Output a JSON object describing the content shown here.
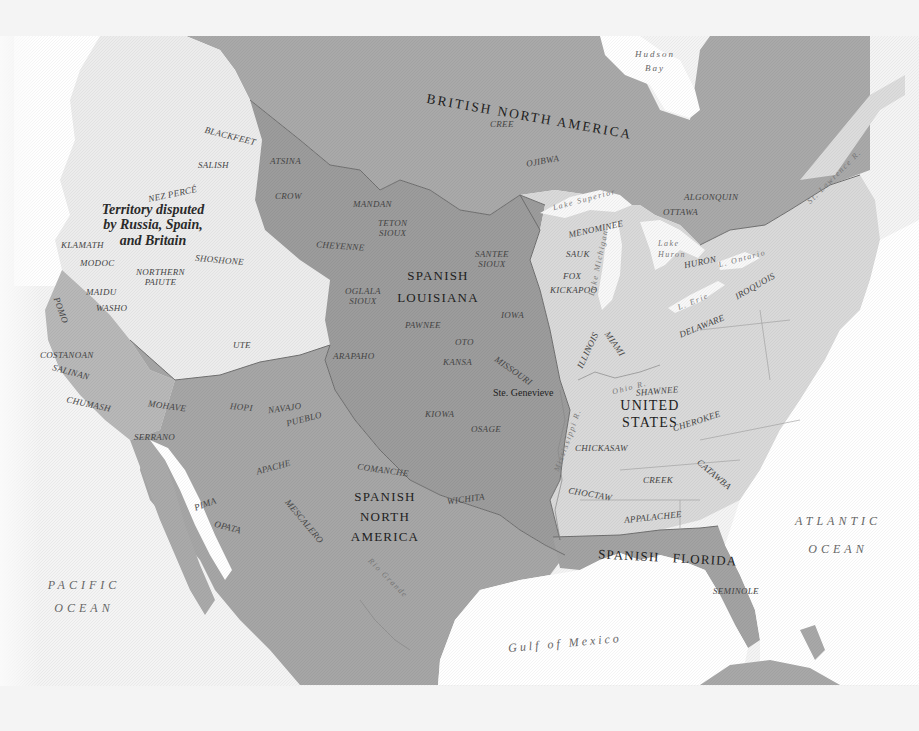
{
  "map": {
    "colors": {
      "background": "#f4f4f4",
      "water": "#ffffff",
      "british_north_america": "#a9a9a9",
      "spanish_louisiana": "#9c9c9c",
      "spanish_north_america": "#a6a6a6",
      "spanish_florida": "#a3a3a3",
      "united_states": "#d9d9d9",
      "disputed_territory": "#ececec",
      "border": "#6e6e6e"
    },
    "regions": {
      "british_north_america": "BRITISH NORTH AMERICA",
      "spanish_louisiana_1": "SPANISH",
      "spanish_louisiana_2": "LOUISIANA",
      "spanish_north_america_1": "SPANISH",
      "spanish_north_america_2": "NORTH",
      "spanish_north_america_3": "AMERICA",
      "united_states_1": "UNITED",
      "united_states_2": "STATES",
      "spanish_florida": "SPANISH   FLORIDA",
      "disputed_1": "Territory disputed",
      "disputed_2": "by Russia, Spain,",
      "disputed_3": "and Britain"
    },
    "water_bodies": {
      "hudson_bay_1": "Hudson",
      "hudson_bay_2": "Bay",
      "pacific_1": "PACIFIC",
      "pacific_2": "OCEAN",
      "atlantic_1": "ATLANTIC",
      "atlantic_2": "OCEAN",
      "gulf": "Gulf of Mexico",
      "lake_superior": "Lake Superior",
      "lake_michigan": "Lake Michigan",
      "lake_huron_1": "Lake",
      "lake_huron_2": "Huron",
      "lake_erie": "L. Erie",
      "lake_ontario": "L. Ontario",
      "st_lawrence": "St. Lawrence R.",
      "ohio_river": "Ohio R.",
      "mississippi_river": "Mississippi R.",
      "rio_grande": "Rio Grande"
    },
    "cities": {
      "ste_genevieve": "Ste. Genevieve"
    },
    "tribes": {
      "blackfeet": "BLACKFEET",
      "salish": "SALISH",
      "nez_perce": "NEZ PERCÉ",
      "atsina": "ATSINA",
      "crow": "CROW",
      "mandan": "MANDAN",
      "teton_sioux_1": "TETON",
      "teton_sioux_2": "SIOUX",
      "cheyenne": "CHEYENNE",
      "klamath": "KLAMATH",
      "modoc": "MODOC",
      "shoshone": "SHOSHONE",
      "northern_paiute_1": "NORTHERN",
      "northern_paiute_2": "PAIUTE",
      "maidu": "MAIDU",
      "washo": "WASHO",
      "pomo": "POMO",
      "costanoan": "COSTANOAN",
      "salinan": "SALINAN",
      "chumash": "CHUMASH",
      "ute": "UTE",
      "oglala_sioux_1": "OGLALA",
      "oglala_sioux_2": "SIOUX",
      "arapaho": "ARAPAHO",
      "pawnee": "PAWNEE",
      "oto": "OTO",
      "kansa": "KANSA",
      "santee_sioux_1": "SANTEE",
      "santee_sioux_2": "SIOUX",
      "iowa": "IOWA",
      "missouri": "MISSOURI",
      "kiowa": "KIOWA",
      "osage": "OSAGE",
      "mohave": "MOHAVE",
      "hopi": "HOPI",
      "navajo": "NAVAJO",
      "pueblo": "PUEBLO",
      "serrano": "SERRANO",
      "apache": "APACHE",
      "comanche": "COMANCHE",
      "pima": "PIMA",
      "opata": "OPATA",
      "mescalero": "MESCALERO",
      "wichita": "WICHITA",
      "cree": "CREE",
      "ojibwa": "OJIBWA",
      "algonquin": "ALGONQUIN",
      "ottawa": "OTTAWA",
      "menominee": "MENOMINEE",
      "sauk": "SAUK",
      "fox": "FOX",
      "kickapoo": "KICKAPOO",
      "huron": "HURON",
      "iroquois": "IROQUOIS",
      "illinois": "ILLINOIS",
      "miami": "MIAMI",
      "delaware": "DELAWARE",
      "shawnee": "SHAWNEE",
      "cherokee": "CHEROKEE",
      "chickasaw": "CHICKASAW",
      "creek": "CREEK",
      "catawba": "CATAWBA",
      "choctaw": "CHOCTAW",
      "appalachee": "APPALACHEE",
      "seminole": "SEMINOLE"
    }
  }
}
